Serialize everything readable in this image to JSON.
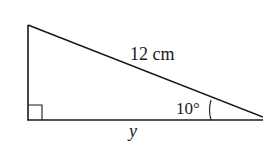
{
  "diagram": {
    "type": "right-triangle",
    "hypotenuse_label": "12 cm",
    "angle_label": "10°",
    "base_label": "y",
    "right_angle_marker": true,
    "stroke_color": "#1a1a1a",
    "background": "#ffffff"
  }
}
